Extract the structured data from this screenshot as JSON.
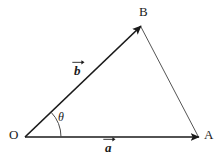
{
  "figure": {
    "kind": "vector-triangle-diagram",
    "background_color": "#ffffff",
    "stroke_color": "#1a1a1a",
    "thin_stroke_color": "#555555",
    "width": 222,
    "height": 157
  },
  "points": {
    "origin": {
      "label": "O",
      "x": 25,
      "y": 137,
      "label_x": 9,
      "label_y": 128
    },
    "a_tip": {
      "label": "A",
      "x": 199,
      "y": 137,
      "label_x": 204,
      "label_y": 128
    },
    "b_tip": {
      "label": "B",
      "x": 141,
      "y": 26,
      "label_x": 139,
      "label_y": 5
    }
  },
  "vectors": [
    {
      "name": "vector-a",
      "label": "a",
      "from": "O",
      "to": "A",
      "x1": 25,
      "y1": 137,
      "x2": 199,
      "y2": 137,
      "label_x": 104,
      "label_y": 141,
      "arrow": true
    },
    {
      "name": "vector-b",
      "label": "b",
      "from": "O",
      "to": "B",
      "x1": 25,
      "y1": 137,
      "x2": 141,
      "y2": 26,
      "label_x": 73,
      "label_y": 64,
      "arrow": true
    }
  ],
  "segments": [
    {
      "name": "segment-BA",
      "from": "B",
      "to": "A",
      "x1": 141,
      "y1": 27,
      "x2": 198,
      "y2": 136,
      "arrow": false
    }
  ],
  "angle": {
    "name": "theta",
    "label": "θ",
    "vertex": "O",
    "radius": 36,
    "label_x": 58,
    "label_y": 111,
    "from_deg": 0,
    "to_deg": 43.7
  }
}
